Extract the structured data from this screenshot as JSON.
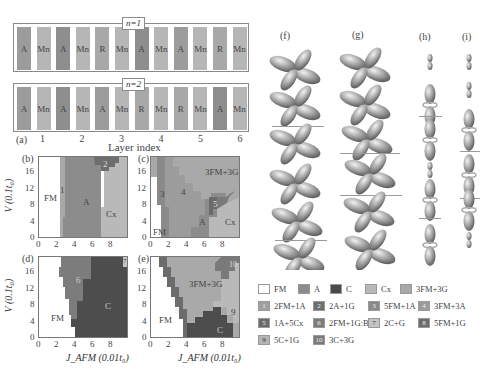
{
  "figure": {
    "panel_a": {
      "label": "(a)",
      "chains": [
        {
          "title": "n=1",
          "cells": [
            "A",
            "Mn",
            "A",
            "Mn",
            "R",
            "Mn",
            "A",
            "Mn",
            "A",
            "Mn",
            "R",
            "Mn"
          ]
        },
        {
          "title": "n=2",
          "cells": [
            "A",
            "Mn",
            "A",
            "Mn",
            "A",
            "Mn",
            "R",
            "Mn",
            "R",
            "Mn",
            "A",
            "Mn"
          ]
        }
      ],
      "layer_ticks": [
        "1",
        "2",
        "3",
        "4",
        "5",
        "6"
      ],
      "xlabel": "Layer index"
    },
    "phase_diagrams": [
      {
        "label": "(b)",
        "regions": [
          "FM",
          "1",
          "A",
          "2",
          "Cx"
        ]
      },
      {
        "label": "(c)",
        "regions": [
          "FM",
          "3",
          "4",
          "A",
          "5",
          "Cx",
          "3FM+3G"
        ]
      },
      {
        "label": "(d)",
        "regions": [
          "FM",
          "6",
          "C",
          "7"
        ]
      },
      {
        "label": "(e)",
        "regions": [
          "FM",
          "8",
          "3FM+3G",
          "9",
          "10",
          "C"
        ]
      }
    ],
    "axes": {
      "y_ticks": [
        "0",
        "4",
        "8",
        "12",
        "16"
      ],
      "x_ticks": [
        "0",
        "2",
        "4",
        "6",
        "8"
      ],
      "ylabel": "V (0.1t₀)",
      "xlabel": "J_AFM (0.01t₀)"
    },
    "orbital_panels": [
      "(f)",
      "(g)",
      "(h)",
      "(i)"
    ],
    "legend": [
      {
        "swatch": "",
        "label": "FM",
        "color": "#ffffff"
      },
      {
        "swatch": "",
        "label": "A",
        "color": "#8c8c8c"
      },
      {
        "swatch": "",
        "label": "C",
        "color": "#4a4a4a"
      },
      {
        "swatch": "",
        "label": "Cx",
        "color": "#b8b8b8"
      },
      {
        "swatch": "",
        "label": "3FM+3G",
        "color": "#a8a8a8"
      },
      {
        "swatch": "1",
        "label": "2FM+1A",
        "color": "#a0a0a0"
      },
      {
        "swatch": "2",
        "label": "2A+1G",
        "color": "#6e6e6e"
      },
      {
        "swatch": "3",
        "label": "5FM+1A",
        "color": "#8a8a8a"
      },
      {
        "swatch": "4",
        "label": "3FM+3A",
        "color": "#9c9c9c"
      },
      {
        "swatch": "5",
        "label": "1A+5Cx",
        "color": "#6a6a6a"
      },
      {
        "swatch": "6",
        "label": "2FM+1G:B",
        "color": "#7c7c7c"
      },
      {
        "swatch": "7",
        "label": "2C+G",
        "color": "#c4c4c4"
      },
      {
        "swatch": "8",
        "label": "5FM+1G",
        "color": "#6c6c6c"
      },
      {
        "swatch": "9",
        "label": "5C+1G",
        "color": "#b4b4b4"
      },
      {
        "swatch": "10",
        "label": "3C+3G",
        "color": "#7a7a7a"
      }
    ]
  },
  "chart_data": [
    {
      "type": "heatmap",
      "title": "(b)",
      "xlabel": "J_AFM (0.01t0)",
      "ylabel": "V (0.1t0)",
      "xlim": [
        0,
        10
      ],
      "ylim": [
        0,
        20
      ],
      "x_ticks": [
        0,
        2,
        4,
        6,
        8
      ],
      "y_ticks": [
        0,
        4,
        8,
        12,
        16
      ],
      "regions": [
        "FM (J<~2.3)",
        "1: 2FM+1A (J~2.3-3)",
        "A (J~3-7)",
        "2: 2A+1G (top, J~6-8, V>17)",
        "Cx (J>~7)"
      ]
    },
    {
      "type": "heatmap",
      "title": "(c)",
      "xlabel": "J_AFM (0.01t0)",
      "ylabel": "V (0.1t0)",
      "xlim": [
        0,
        10
      ],
      "ylim": [
        0,
        20
      ],
      "regions": [
        "FM (small J, low V)",
        "3: 5FM+1A",
        "4: 3FM+3A",
        "A",
        "5: 1A+5Cx",
        "Cx",
        "3FM+3G (upper right)"
      ]
    },
    {
      "type": "heatmap",
      "title": "(d)",
      "xlabel": "J_AFM (0.01t0)",
      "ylabel": "V (0.1t0)",
      "xlim": [
        0,
        10
      ],
      "ylim": [
        0,
        20
      ],
      "regions": [
        "FM (J<~2.5-4.8)",
        "6: 2FM+1G:B",
        "C (J>~5)",
        "7: 2C+G (top right corner)"
      ]
    },
    {
      "type": "heatmap",
      "title": "(e)",
      "xlabel": "J_AFM (0.01t0)",
      "ylabel": "V (0.1t0)",
      "xlim": [
        0,
        10
      ],
      "ylim": [
        0,
        20
      ],
      "regions": [
        "FM (lower left)",
        "8: 5FM+1G",
        "3FM+3G (center)",
        "9: 5C+1G (right)",
        "10: 3C+3G (top right)",
        "C (bottom right)"
      ]
    }
  ]
}
